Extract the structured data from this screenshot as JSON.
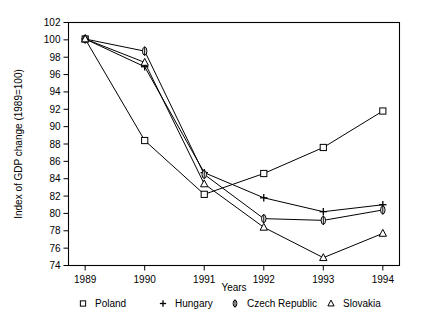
{
  "chart_data": {
    "type": "line",
    "title": "",
    "xlabel": "Years",
    "ylabel": "Index of GDP change (1989=100)",
    "x": [
      1989,
      1990,
      1991,
      1992,
      1993,
      1994
    ],
    "xticklabels": [
      "1989",
      "1990",
      "1991",
      "1992",
      "1993",
      "1994"
    ],
    "yticklabels": [
      "74",
      "76",
      "78",
      "80",
      "82",
      "84",
      "86",
      "88",
      "90",
      "92",
      "94",
      "96",
      "98",
      "100",
      "102"
    ],
    "yticks": [
      74,
      76,
      78,
      80,
      82,
      84,
      86,
      88,
      90,
      92,
      94,
      96,
      98,
      100,
      102
    ],
    "xlim": [
      1988.72,
      1994.28
    ],
    "ylim": [
      74,
      102
    ],
    "grid": false,
    "legend_position": "bottom",
    "series": [
      {
        "name": "Poland",
        "marker": "square",
        "values": [
          100.1,
          88.4,
          82.2,
          84.6,
          87.6,
          91.8
        ]
      },
      {
        "name": "Hungary",
        "marker": "plus",
        "values": [
          100.1,
          96.9,
          84.7,
          81.8,
          80.2,
          81.0
        ]
      },
      {
        "name": "Czech Republic",
        "marker": "ellipse-bar",
        "values": [
          100.1,
          98.7,
          84.5,
          79.4,
          79.2,
          80.4
        ]
      },
      {
        "name": "Slovakia",
        "marker": "triangle",
        "values": [
          100.1,
          97.4,
          83.4,
          78.4,
          74.9,
          77.7
        ]
      }
    ]
  },
  "legend": {
    "items": [
      {
        "label": "Poland",
        "marker": "square"
      },
      {
        "label": "Hungary",
        "marker": "plus"
      },
      {
        "label": "Czech Republic",
        "marker": "ellipse-bar"
      },
      {
        "label": "Slovakia",
        "marker": "triangle"
      }
    ]
  }
}
